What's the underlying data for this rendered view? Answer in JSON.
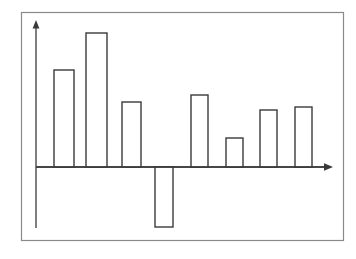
{
  "figure": {
    "background_color": "#ffffff",
    "frame_color": "#8a8a8a",
    "axis_color": "#3a3a3a",
    "bar_edge_color": "#3a3a3a",
    "bar_fill_color": "#ffffff",
    "frame": {
      "x": 21,
      "y": 12,
      "width": 323,
      "height": 229
    }
  },
  "chart_data": {
    "type": "bar",
    "title": "",
    "subtitle": "",
    "xlabel": "",
    "ylabel": "",
    "categories": [
      "1",
      "2",
      "3",
      "4",
      "5",
      "6",
      "7",
      "8"
    ],
    "values": [
      4.85,
      6.7,
      3.25,
      -6.0,
      3.6,
      1.45,
      2.85,
      3.0
    ],
    "ylim": [
      -6.5,
      7.5
    ],
    "xlim": [
      0,
      9
    ],
    "grid": false,
    "legend": null,
    "annotations": [],
    "tick_labels": {
      "x": [],
      "y": []
    },
    "axes_style": "arrowed-spines",
    "baseline_value": 0
  },
  "geometry": {
    "baseline_y": 167,
    "y_axis_x": 36,
    "y_axis_top": 23,
    "y_axis_bottom": 228,
    "x_axis_left": 36,
    "x_axis_right": 331,
    "bars": [
      {
        "name": "bar-1",
        "x": 54,
        "width": 20,
        "top": 70,
        "bottom": 167,
        "sign": "positive"
      },
      {
        "name": "bar-2",
        "x": 86,
        "width": 21,
        "top": 33,
        "bottom": 167,
        "sign": "positive"
      },
      {
        "name": "bar-3",
        "x": 122,
        "width": 19,
        "top": 102,
        "bottom": 167,
        "sign": "positive"
      },
      {
        "name": "bar-4",
        "x": 155,
        "width": 18,
        "top": 167,
        "bottom": 227,
        "sign": "negative"
      },
      {
        "name": "bar-5",
        "x": 191,
        "width": 17,
        "top": 95,
        "bottom": 167,
        "sign": "positive"
      },
      {
        "name": "bar-6",
        "x": 226,
        "width": 17,
        "top": 138,
        "bottom": 167,
        "sign": "positive"
      },
      {
        "name": "bar-7",
        "x": 260,
        "width": 17,
        "top": 110,
        "bottom": 167,
        "sign": "positive"
      },
      {
        "name": "bar-8",
        "x": 295,
        "width": 17,
        "top": 107,
        "bottom": 167,
        "sign": "positive"
      }
    ]
  }
}
